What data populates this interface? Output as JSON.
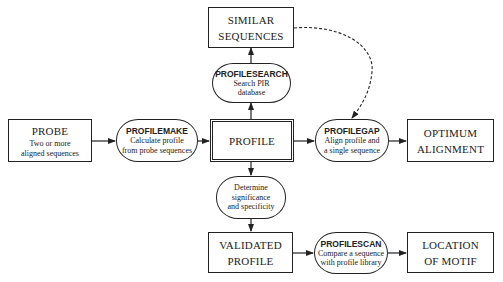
{
  "diagram": {
    "nodes": {
      "probe": {
        "title": "PROBE",
        "desc1": "Two or more",
        "desc2": "aligned sequences"
      },
      "profilemake": {
        "program": "PROFILEMAKE",
        "desc1": "Calculate profile",
        "desc2": "from probe sequences"
      },
      "profile": {
        "title": "PROFILE"
      },
      "similar": {
        "title1": "SIMILAR",
        "title2": "SEQUENCES"
      },
      "profilesearch": {
        "program": "PROFILESEARCH",
        "desc1": "Search PIR",
        "desc2": "database"
      },
      "profilegap": {
        "program": "PROFILEGAP",
        "desc1": "Align profile and",
        "desc2": "a single sequence"
      },
      "optimum": {
        "title1": "OPTIMUM",
        "title2": "ALIGNMENT"
      },
      "determine": {
        "desc1": "Determine significance",
        "desc2": "and specificity"
      },
      "validated": {
        "title1": "VALIDATED",
        "title2": "PROFILE"
      },
      "profilescan": {
        "program": "PROFILESCAN",
        "desc1": "Compare a sequence",
        "desc2": "with profile library"
      },
      "location": {
        "title1": "LOCATION",
        "title2": "OF MOTIF"
      }
    },
    "edges": [
      {
        "from": "probe",
        "to": "profilemake",
        "style": "solid"
      },
      {
        "from": "profilemake",
        "to": "profile",
        "style": "solid"
      },
      {
        "from": "profile",
        "to": "profilesearch",
        "style": "solid"
      },
      {
        "from": "profilesearch",
        "to": "similar",
        "style": "solid"
      },
      {
        "from": "profile",
        "to": "profilegap",
        "style": "solid"
      },
      {
        "from": "similar",
        "to": "profilegap",
        "style": "dashed"
      },
      {
        "from": "profilegap",
        "to": "optimum",
        "style": "solid"
      },
      {
        "from": "profile",
        "to": "determine",
        "style": "solid"
      },
      {
        "from": "determine",
        "to": "validated",
        "style": "solid"
      },
      {
        "from": "validated",
        "to": "profilescan",
        "style": "solid"
      },
      {
        "from": "profilescan",
        "to": "location",
        "style": "solid"
      }
    ],
    "colors": {
      "line": "#222222",
      "background": "#ffffff"
    }
  }
}
